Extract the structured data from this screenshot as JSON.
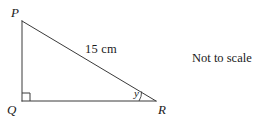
{
  "figure": {
    "type": "right-triangle-geometry-diagram",
    "background_color": "#ffffff",
    "stroke_color": "#3a3a3a",
    "text_color": "#1a1a1a",
    "vertices": {
      "p": {
        "label": "P",
        "x": 22,
        "y": 21
      },
      "q": {
        "label": "Q",
        "x": 22,
        "y": 101
      },
      "r": {
        "label": "R",
        "x": 156,
        "y": 101
      }
    },
    "sides": {
      "hypotenuse_label": "15 cm",
      "hypotenuse_from": "P",
      "hypotenuse_to": "R"
    },
    "angles": {
      "right_angle_at": "Q",
      "marked_angle_label": "y",
      "marked_angle_at": "R"
    },
    "notes": {
      "not_to_scale": "Not to scale"
    }
  }
}
